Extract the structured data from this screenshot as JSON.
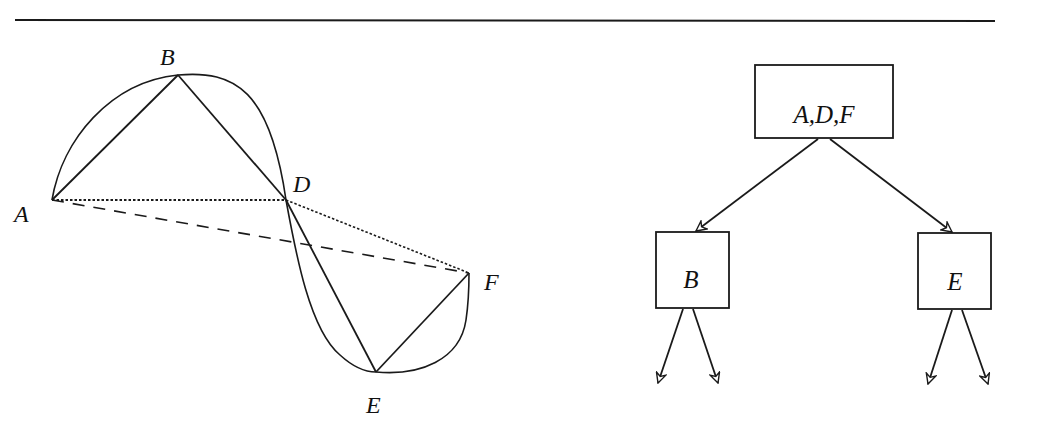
{
  "figure": {
    "stroke_color": "#1a1a1a",
    "background": "#ffffff",
    "curve_diagram": {
      "points": [
        {
          "id": "A",
          "label": "A",
          "x": 52,
          "y": 200,
          "lx": 14,
          "ly": 222
        },
        {
          "id": "B",
          "label": "B",
          "x": 178,
          "y": 75,
          "lx": 160,
          "ly": 65
        },
        {
          "id": "D",
          "label": "D",
          "x": 286,
          "y": 200,
          "lx": 293,
          "ly": 192
        },
        {
          "id": "E",
          "label": "E",
          "x": 376,
          "y": 372,
          "lx": 366,
          "ly": 413
        },
        {
          "id": "F",
          "label": "F",
          "x": 469,
          "y": 273,
          "lx": 484,
          "ly": 290
        }
      ],
      "solid_segments": [
        [
          "A",
          "B"
        ],
        [
          "B",
          "D"
        ],
        [
          "D",
          "E"
        ],
        [
          "E",
          "F"
        ]
      ],
      "dotted_segments": [
        [
          "A",
          "D"
        ],
        [
          "D",
          "F"
        ]
      ],
      "dashed_segments": [
        [
          "A",
          "F"
        ]
      ]
    },
    "tree": {
      "root": {
        "label": "A,D,F",
        "x": 755,
        "y": 65,
        "w": 138,
        "h": 73
      },
      "children": [
        {
          "label": "B",
          "x": 656,
          "y": 232,
          "w": 73,
          "h": 76
        },
        {
          "label": "E",
          "x": 918,
          "y": 233,
          "w": 73,
          "h": 76
        }
      ]
    }
  }
}
